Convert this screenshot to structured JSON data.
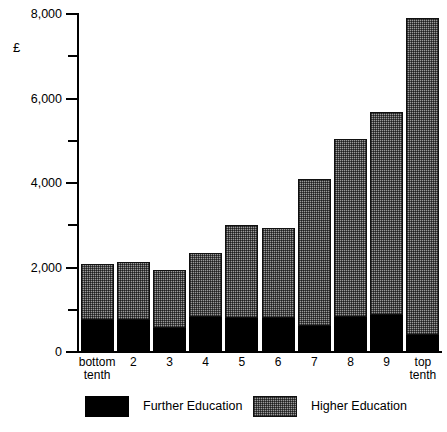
{
  "chart_data": {
    "type": "bar",
    "stacked": true,
    "title": "",
    "subtitle": "",
    "xlabel": "",
    "ylabel": "£",
    "ylim": [
      0,
      8000
    ],
    "ytick_labels": [
      "0",
      "2,000",
      "4,000",
      "6,000",
      "8,000"
    ],
    "ytick_values": [
      0,
      2000,
      4000,
      6000,
      8000
    ],
    "yminor_values": [
      1000,
      3000,
      5000,
      7000
    ],
    "grid": false,
    "legend_position": "bottom",
    "categories": [
      "bottom\ntenth",
      "2",
      "3",
      "4",
      "5",
      "6",
      "7",
      "8",
      "9",
      "top\ntenth"
    ],
    "series": [
      {
        "name": "Further Education",
        "color": "#000000",
        "values": [
          760,
          760,
          570,
          830,
          810,
          810,
          620,
          830,
          880,
          410
        ]
      },
      {
        "name": "Higher Education",
        "color": "#9a9a9a",
        "values": [
          1320,
          1370,
          1380,
          1520,
          2190,
          2120,
          3480,
          4220,
          4810,
          7490
        ]
      }
    ],
    "totals": [
      2080,
      2130,
      1950,
      2350,
      3000,
      2930,
      4100,
      5050,
      5690,
      7900
    ]
  },
  "legend": {
    "items": [
      {
        "label": "Further Education",
        "swatch": "solid-black"
      },
      {
        "label": "Higher Education",
        "swatch": "hatched-gray"
      }
    ]
  }
}
